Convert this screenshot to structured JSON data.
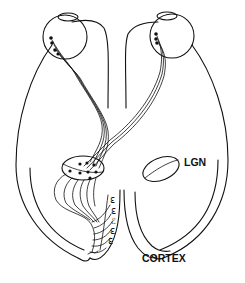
{
  "diagram": {
    "type": "neuroanatomy-schematic",
    "labels": {
      "lgn": "LGN",
      "cortex": "CORTEX"
    },
    "structures": [
      {
        "name": "left-eye",
        "side": "left"
      },
      {
        "name": "right-eye",
        "side": "right"
      },
      {
        "name": "left-hemisphere",
        "side": "left"
      },
      {
        "name": "right-hemisphere",
        "side": "right"
      },
      {
        "name": "left-lgn",
        "side": "left",
        "detailed": true
      },
      {
        "name": "right-lgn",
        "side": "right",
        "labeled": "LGN"
      },
      {
        "name": "left-cortex",
        "side": "left"
      },
      {
        "name": "right-cortex",
        "side": "right",
        "labeled": "CORTEX"
      }
    ],
    "colors": {
      "line": "#111111",
      "background": "#ffffff"
    }
  }
}
